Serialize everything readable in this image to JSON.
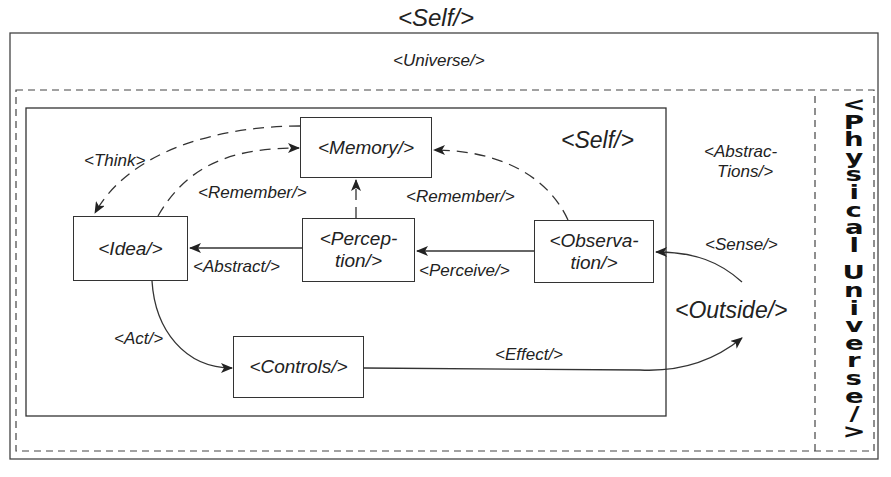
{
  "title": "<Self/>",
  "outer_frame": {
    "label": "<Universe/>"
  },
  "outside_region": {
    "abstractions_label_line1": "<Abstrac-",
    "abstractions_label_line2": "Tions/>",
    "sense_label": "<Sense/>",
    "outside_label": "<Outside/>"
  },
  "physical_universe": {
    "label": "<Physical Universe/>",
    "chars": [
      "<",
      "P",
      "h",
      "y",
      "s",
      "i",
      "c",
      "a",
      "l",
      " ",
      "U",
      "n",
      "i",
      "v",
      "e",
      "r",
      "s",
      "e",
      "/",
      ">"
    ]
  },
  "self_box": {
    "label": "<Self/>"
  },
  "nodes": {
    "memory": {
      "label": "<Memory/>"
    },
    "idea": {
      "label": "<Idea/>"
    },
    "perception": {
      "line1": "<Percep-",
      "line2": "tion/>"
    },
    "observation": {
      "line1": "<Observa-",
      "line2": "tion/>"
    },
    "controls": {
      "label": "<Controls/>"
    }
  },
  "edges": {
    "think": "<Think>",
    "remember_left": "<Remember/>",
    "remember_right": "<Remember/>",
    "abstract": "<Abstract/>",
    "perceive": "<Perceive/>",
    "act": "<Act/>",
    "effect": "<Effect/>"
  },
  "colors": {
    "stroke": "#333333",
    "text": "#222222",
    "background": "#ffffff"
  }
}
